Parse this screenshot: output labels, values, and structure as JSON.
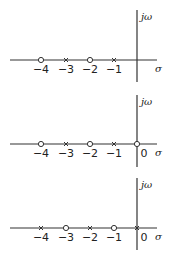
{
  "diagram": {
    "type": "pole-zero plots (s-plane)",
    "axis_labels": {
      "vertical": "jω",
      "horizontal": "σ"
    },
    "marker_legend": {
      "pole": "×",
      "zero": "○"
    },
    "panels": [
      {
        "id": "panel-1",
        "ticks": [
          {
            "value": -4,
            "label": "−4"
          },
          {
            "value": -3,
            "label": "−3"
          },
          {
            "value": -2,
            "label": "−2"
          },
          {
            "value": -1,
            "label": "−1"
          }
        ],
        "markers": [
          {
            "value": -4,
            "kind": "zero"
          },
          {
            "value": -3,
            "kind": "pole"
          },
          {
            "value": -2,
            "kind": "zero"
          },
          {
            "value": -1,
            "kind": "pole"
          }
        ]
      },
      {
        "id": "panel-2",
        "ticks": [
          {
            "value": -4,
            "label": "−4"
          },
          {
            "value": -3,
            "label": "−3"
          },
          {
            "value": -2,
            "label": "−2"
          },
          {
            "value": -1,
            "label": "−1"
          },
          {
            "value": 0,
            "label": "0"
          }
        ],
        "markers": [
          {
            "value": -4,
            "kind": "zero"
          },
          {
            "value": -3,
            "kind": "pole"
          },
          {
            "value": -2,
            "kind": "zero"
          },
          {
            "value": -1,
            "kind": "pole"
          },
          {
            "value": 0,
            "kind": "zero"
          }
        ]
      },
      {
        "id": "panel-3",
        "ticks": [
          {
            "value": -4,
            "label": "−4"
          },
          {
            "value": -3,
            "label": "−3"
          },
          {
            "value": -2,
            "label": "−2"
          },
          {
            "value": -1,
            "label": "−1"
          },
          {
            "value": 0,
            "label": "0"
          }
        ],
        "markers": [
          {
            "value": -4,
            "kind": "pole"
          },
          {
            "value": -3,
            "kind": "zero"
          },
          {
            "value": -2,
            "kind": "pole"
          },
          {
            "value": -1,
            "kind": "zero"
          },
          {
            "value": 0,
            "kind": "pole"
          }
        ]
      }
    ]
  }
}
